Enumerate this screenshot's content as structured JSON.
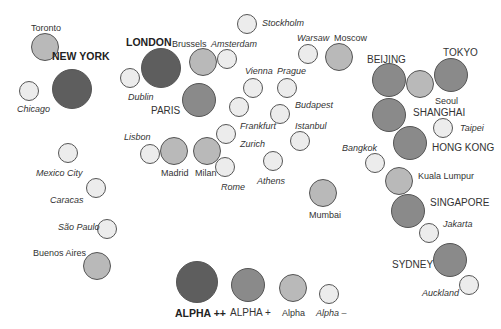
{
  "tiers": {
    "alpha_pp": {
      "label": "ALPHA ++",
      "color": "#5e5e5e"
    },
    "alpha_p": {
      "label": "ALPHA +",
      "color": "#8a8a8a"
    },
    "alpha": {
      "label": "Alpha",
      "color": "#b9b9b9"
    },
    "alpha_m": {
      "label": "Alpha –",
      "color": "#ececec"
    }
  },
  "cities": [
    {
      "name": "Toronto",
      "tier": "alpha",
      "x": 45,
      "y": 47,
      "r": 14,
      "lx": 31,
      "ly": 23,
      "style": "normal"
    },
    {
      "name": "NEW YORK",
      "tier": "alpha_pp",
      "x": 72,
      "y": 89,
      "r": 20,
      "lx": 52,
      "ly": 51,
      "style": "big"
    },
    {
      "name": "Chicago",
      "tier": "alpha_m",
      "x": 29,
      "y": 91,
      "r": 10,
      "lx": 17,
      "ly": 104,
      "style": "it"
    },
    {
      "name": "LONDON",
      "tier": "alpha_pp",
      "x": 161,
      "y": 68,
      "r": 20,
      "lx": 126,
      "ly": 37,
      "style": "big"
    },
    {
      "name": "Brussels",
      "tier": "alpha",
      "x": 203,
      "y": 62,
      "r": 14,
      "lx": 172,
      "ly": 39,
      "style": "normal"
    },
    {
      "name": "Amsterdam",
      "tier": "alpha_m",
      "x": 227,
      "y": 59,
      "r": 10,
      "lx": 211,
      "ly": 39,
      "style": "it"
    },
    {
      "name": "Dublin",
      "tier": "alpha_m",
      "x": 130,
      "y": 78,
      "r": 10,
      "lx": 128,
      "ly": 92,
      "style": "it"
    },
    {
      "name": "PARIS",
      "tier": "alpha_p",
      "x": 199,
      "y": 100,
      "r": 17,
      "lx": 151,
      "ly": 106,
      "style": "caps"
    },
    {
      "name": "Stockholm",
      "tier": "alpha_m",
      "x": 247,
      "y": 24,
      "r": 10,
      "lx": 262,
      "ly": 18,
      "style": "it"
    },
    {
      "name": "Warsaw",
      "tier": "alpha_m",
      "x": 308,
      "y": 54,
      "r": 10,
      "lx": 297,
      "ly": 33,
      "style": "it"
    },
    {
      "name": "Moscow",
      "tier": "alpha",
      "x": 339,
      "y": 57,
      "r": 14,
      "lx": 334,
      "ly": 33,
      "style": "normal"
    },
    {
      "name": "Vienna",
      "tier": "alpha_m",
      "x": 253,
      "y": 88,
      "r": 10,
      "lx": 245,
      "ly": 66,
      "style": "it"
    },
    {
      "name": "Prague",
      "tier": "alpha_m",
      "x": 287,
      "y": 88,
      "r": 10,
      "lx": 277,
      "ly": 66,
      "style": "it"
    },
    {
      "name": "Budapest",
      "tier": "alpha_m",
      "x": 280,
      "y": 114,
      "r": 10,
      "lx": 295,
      "ly": 100,
      "style": "it"
    },
    {
      "name": "Istanbul",
      "tier": "alpha_m",
      "x": 300,
      "y": 141,
      "r": 10,
      "lx": 295,
      "ly": 121,
      "style": "it"
    },
    {
      "name": "Frankfurt",
      "tier": "alpha_m",
      "x": 239,
      "y": 107,
      "r": 10,
      "lx": 240,
      "ly": 121,
      "style": "it"
    },
    {
      "name": "Zurich",
      "tier": "alpha_m",
      "x": 226,
      "y": 134,
      "r": 10,
      "lx": 240,
      "ly": 139,
      "style": "it"
    },
    {
      "name": "Lisbon",
      "tier": "alpha_m",
      "x": 150,
      "y": 154,
      "r": 10,
      "lx": 124,
      "ly": 132,
      "style": "it"
    },
    {
      "name": "Madrid",
      "tier": "alpha",
      "x": 174,
      "y": 151,
      "r": 14,
      "lx": 161,
      "ly": 168,
      "style": "normal"
    },
    {
      "name": "Milan",
      "tier": "alpha",
      "x": 207,
      "y": 151,
      "r": 14,
      "lx": 195,
      "ly": 168,
      "style": "normal"
    },
    {
      "name": "Rome",
      "tier": "alpha_m",
      "x": 225,
      "y": 167,
      "r": 10,
      "lx": 221,
      "ly": 182,
      "style": "it"
    },
    {
      "name": "Athens",
      "tier": "alpha_m",
      "x": 273,
      "y": 161,
      "r": 10,
      "lx": 257,
      "ly": 176,
      "style": "it"
    },
    {
      "name": "Mumbai",
      "tier": "alpha",
      "x": 323,
      "y": 193,
      "r": 14,
      "lx": 309,
      "ly": 210,
      "style": "normal"
    },
    {
      "name": "Bangkok",
      "tier": "alpha_m",
      "x": 375,
      "y": 163,
      "r": 10,
      "lx": 342,
      "ly": 143,
      "style": "it"
    },
    {
      "name": "BEIJING",
      "tier": "alpha_p",
      "x": 389,
      "y": 80,
      "r": 17,
      "lx": 367,
      "ly": 55,
      "style": "caps"
    },
    {
      "name": "Seoul",
      "tier": "alpha",
      "x": 420,
      "y": 84,
      "r": 14,
      "lx": 435,
      "ly": 96,
      "style": "normal"
    },
    {
      "name": "TOKYO",
      "tier": "alpha_p",
      "x": 451,
      "y": 75,
      "r": 17,
      "lx": 443,
      "ly": 48,
      "style": "caps"
    },
    {
      "name": "SHANGHAI",
      "tier": "alpha_p",
      "x": 389,
      "y": 115,
      "r": 17,
      "lx": 413,
      "ly": 108,
      "style": "caps"
    },
    {
      "name": "Taipei",
      "tier": "alpha_m",
      "x": 443,
      "y": 128,
      "r": 10,
      "lx": 460,
      "ly": 123,
      "style": "it"
    },
    {
      "name": "HONG KONG",
      "tier": "alpha_p",
      "x": 410,
      "y": 143,
      "r": 17,
      "lx": 432,
      "ly": 143,
      "style": "caps"
    },
    {
      "name": "Kuala Lumpur",
      "tier": "alpha",
      "x": 399,
      "y": 181,
      "r": 14,
      "lx": 418,
      "ly": 171,
      "style": "normal"
    },
    {
      "name": "SINGAPORE",
      "tier": "alpha_p",
      "x": 408,
      "y": 211,
      "r": 17,
      "lx": 430,
      "ly": 198,
      "style": "caps"
    },
    {
      "name": "Jakarta",
      "tier": "alpha_m",
      "x": 429,
      "y": 233,
      "r": 10,
      "lx": 443,
      "ly": 219,
      "style": "it"
    },
    {
      "name": "SYDNEY",
      "tier": "alpha_p",
      "x": 450,
      "y": 260,
      "r": 17,
      "lx": 392,
      "ly": 260,
      "style": "caps"
    },
    {
      "name": "Auckland",
      "tier": "alpha_m",
      "x": 469,
      "y": 285,
      "r": 10,
      "lx": 422,
      "ly": 288,
      "style": "it"
    },
    {
      "name": "Mexico City",
      "tier": "alpha_m",
      "x": 68,
      "y": 153,
      "r": 10,
      "lx": 36,
      "ly": 168,
      "style": "it"
    },
    {
      "name": "Caracas",
      "tier": "alpha_m",
      "x": 96,
      "y": 188,
      "r": 10,
      "lx": 50,
      "ly": 195,
      "style": "it"
    },
    {
      "name": "São Paulo",
      "tier": "alpha_m",
      "x": 107,
      "y": 229,
      "r": 10,
      "lx": 58,
      "ly": 222,
      "style": "it"
    },
    {
      "name": "Buenos Aires",
      "tier": "alpha",
      "x": 97,
      "y": 266,
      "r": 14,
      "lx": 33,
      "ly": 248,
      "style": "normal"
    }
  ],
  "legend": [
    {
      "tier": "alpha_pp",
      "label": "ALPHA ++",
      "x": 197,
      "y": 282,
      "r": 21,
      "lx": 175,
      "ly": 308,
      "style": "big"
    },
    {
      "tier": "alpha_p",
      "label": "ALPHA +",
      "x": 248,
      "y": 285,
      "r": 17,
      "lx": 230,
      "ly": 308,
      "style": "caps"
    },
    {
      "tier": "alpha",
      "label": "Alpha",
      "x": 293,
      "y": 288,
      "r": 14,
      "lx": 282,
      "ly": 308,
      "style": "normal"
    },
    {
      "tier": "alpha_m",
      "label": "Alpha –",
      "x": 329,
      "y": 294,
      "r": 10,
      "lx": 316,
      "ly": 308,
      "style": "it"
    }
  ]
}
